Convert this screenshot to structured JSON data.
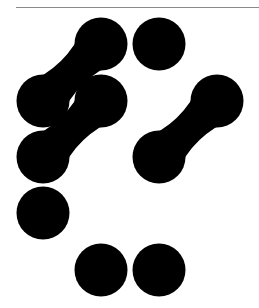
{
  "colors": {
    "background": "#ffffff",
    "shape": "#000000",
    "rule": "#8a8a8a"
  },
  "figure": {
    "radius": 26.5,
    "singles": [
      {
        "cx": 159,
        "cy": 44
      },
      {
        "cx": 43,
        "cy": 213
      },
      {
        "cx": 101,
        "cy": 270
      },
      {
        "cx": 159,
        "cy": 270
      }
    ],
    "pairs": [
      {
        "a": {
          "cx": 101,
          "cy": 44
        },
        "b": {
          "cx": 43,
          "cy": 101
        }
      },
      {
        "a": {
          "cx": 101,
          "cy": 101
        },
        "b": {
          "cx": 43,
          "cy": 157
        }
      },
      {
        "a": {
          "cx": 217,
          "cy": 101
        },
        "b": {
          "cx": 159,
          "cy": 157
        }
      }
    ]
  }
}
